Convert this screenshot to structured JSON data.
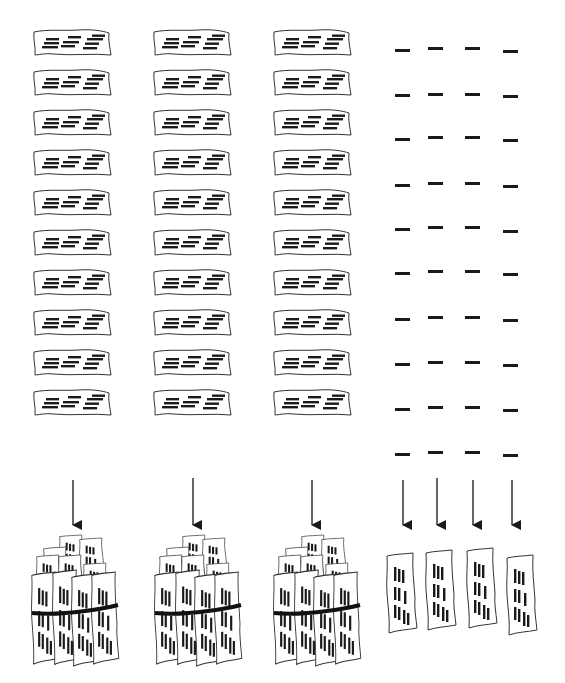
{
  "diagram": {
    "colors": {
      "ink": "#1a1a1a",
      "paper": "#ffffff",
      "background": "#ffffff"
    },
    "strip_columns_x": [
      33,
      153,
      273
    ],
    "row_y": [
      28,
      68,
      108,
      148,
      188,
      228,
      268,
      308,
      348,
      388
    ],
    "strip_size": {
      "w": 78,
      "h": 28
    },
    "dash_columns_x": [
      395,
      428,
      465,
      503
    ],
    "dash_width": 15,
    "arrows": [
      {
        "x": 73,
        "y1": 480,
        "y2": 525
      },
      {
        "x": 193,
        "y1": 478,
        "y2": 525
      },
      {
        "x": 312,
        "y1": 480,
        "y2": 525
      },
      {
        "x": 403,
        "y1": 480,
        "y2": 525
      },
      {
        "x": 437,
        "y1": 478,
        "y2": 525
      },
      {
        "x": 473,
        "y1": 480,
        "y2": 525
      },
      {
        "x": 512,
        "y1": 480,
        "y2": 525
      }
    ],
    "bundles_x": [
      30,
      153,
      272
    ],
    "bundle_y": 535,
    "single_vertical_strips": [
      {
        "x": 385,
        "y": 553
      },
      {
        "x": 424,
        "y": 550
      },
      {
        "x": 465,
        "y": 548
      },
      {
        "x": 505,
        "y": 555
      }
    ]
  }
}
